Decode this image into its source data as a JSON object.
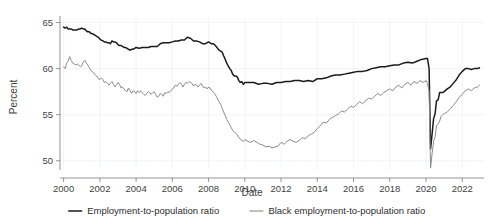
{
  "chart_data": {
    "type": "line",
    "title": "",
    "xlabel": "Date",
    "ylabel": "Percent",
    "xlim": [
      1999.8,
      2023.2
    ],
    "ylim": [
      49.0,
      65.6
    ],
    "grid": true,
    "legend_position": "bottom",
    "yticks": [
      50,
      55,
      60,
      65
    ],
    "ytick_labels": [
      "50",
      "55",
      "60",
      "65"
    ],
    "xticks": [
      2000,
      2002,
      2004,
      2006,
      2008,
      2010,
      2012,
      2014,
      2016,
      2018,
      2020,
      2022
    ],
    "xtick_labels": [
      "2000",
      "2002",
      "2004",
      "2006",
      "2008",
      "2010",
      "2012",
      "2014",
      "2016",
      "2018",
      "2020",
      "2022"
    ],
    "series": [
      {
        "name": "Employment-to-population ratio",
        "color": "#1a1a1a",
        "x": [
          2000.0,
          2000.08,
          2000.17,
          2000.25,
          2000.33,
          2000.42,
          2000.5,
          2000.58,
          2000.67,
          2000.75,
          2000.83,
          2000.92,
          2001.0,
          2001.08,
          2001.17,
          2001.25,
          2001.33,
          2001.42,
          2001.5,
          2001.58,
          2001.67,
          2001.75,
          2001.83,
          2001.92,
          2002.0,
          2002.08,
          2002.17,
          2002.25,
          2002.33,
          2002.42,
          2002.5,
          2002.58,
          2002.67,
          2002.75,
          2002.83,
          2002.92,
          2003.0,
          2003.08,
          2003.17,
          2003.25,
          2003.33,
          2003.42,
          2003.5,
          2003.58,
          2003.67,
          2003.75,
          2003.83,
          2003.92,
          2004.0,
          2004.17,
          2004.33,
          2004.5,
          2004.67,
          2004.83,
          2005.0,
          2005.17,
          2005.33,
          2005.5,
          2005.67,
          2005.83,
          2006.0,
          2006.17,
          2006.33,
          2006.5,
          2006.67,
          2006.83,
          2007.0,
          2007.17,
          2007.33,
          2007.5,
          2007.67,
          2007.83,
          2008.0,
          2008.08,
          2008.17,
          2008.25,
          2008.33,
          2008.42,
          2008.5,
          2008.58,
          2008.67,
          2008.75,
          2008.83,
          2008.92,
          2009.0,
          2009.08,
          2009.17,
          2009.25,
          2009.33,
          2009.42,
          2009.5,
          2009.58,
          2009.67,
          2009.75,
          2009.83,
          2009.92,
          2010.0,
          2010.25,
          2010.5,
          2010.75,
          2011.0,
          2011.25,
          2011.5,
          2011.75,
          2012.0,
          2012.25,
          2012.5,
          2012.75,
          2013.0,
          2013.25,
          2013.5,
          2013.75,
          2014.0,
          2014.25,
          2014.5,
          2014.75,
          2015.0,
          2015.25,
          2015.5,
          2015.75,
          2016.0,
          2016.25,
          2016.5,
          2016.75,
          2017.0,
          2017.25,
          2017.5,
          2017.75,
          2018.0,
          2018.25,
          2018.5,
          2018.75,
          2019.0,
          2019.25,
          2019.5,
          2019.75,
          2020.0,
          2020.08,
          2020.17,
          2020.25,
          2020.33,
          2020.42,
          2020.5,
          2020.58,
          2020.67,
          2020.75,
          2020.83,
          2020.92,
          2021.0,
          2021.17,
          2021.33,
          2021.5,
          2021.67,
          2021.83,
          2022.0,
          2022.17,
          2022.33,
          2022.5,
          2022.67,
          2022.83,
          2022.95
        ],
        "y": [
          64.5,
          64.4,
          64.5,
          64.3,
          64.3,
          64.3,
          64.2,
          64.2,
          64.2,
          64.2,
          64.3,
          64.3,
          64.4,
          64.3,
          64.3,
          64.1,
          64.0,
          64.0,
          63.8,
          63.8,
          63.7,
          63.6,
          63.5,
          63.4,
          63.2,
          63.1,
          63.0,
          62.9,
          62.9,
          62.8,
          62.8,
          62.7,
          63.0,
          62.9,
          62.9,
          62.8,
          62.6,
          62.5,
          62.5,
          62.4,
          62.3,
          62.3,
          62.2,
          62.1,
          62.0,
          62.1,
          62.1,
          62.2,
          62.3,
          62.2,
          62.3,
          62.3,
          62.3,
          62.4,
          62.4,
          62.4,
          62.7,
          62.8,
          62.8,
          62.8,
          62.9,
          63.0,
          63.0,
          63.1,
          63.1,
          63.4,
          63.3,
          63.0,
          63.0,
          62.9,
          62.7,
          62.7,
          62.9,
          62.8,
          62.7,
          62.7,
          62.6,
          62.4,
          62.2,
          62.0,
          61.9,
          61.8,
          61.4,
          61.0,
          60.6,
          60.3,
          60.0,
          59.8,
          59.4,
          59.2,
          59.2,
          59.1,
          58.7,
          58.5,
          58.6,
          58.3,
          58.5,
          58.5,
          58.5,
          58.3,
          58.4,
          58.4,
          58.3,
          58.5,
          58.5,
          58.6,
          58.6,
          58.7,
          58.7,
          58.6,
          58.7,
          58.6,
          58.9,
          58.9,
          59.0,
          59.2,
          59.3,
          59.3,
          59.4,
          59.5,
          59.6,
          59.7,
          59.7,
          59.8,
          60.0,
          60.1,
          60.2,
          60.2,
          60.3,
          60.4,
          60.4,
          60.6,
          60.7,
          60.6,
          60.8,
          61.0,
          61.1,
          61.1,
          60.0,
          51.3,
          52.8,
          54.6,
          55.1,
          56.5,
          56.6,
          57.4,
          57.4,
          57.4,
          57.5,
          57.8,
          58.0,
          58.4,
          58.8,
          59.3,
          59.7,
          60.0,
          60.0,
          59.9,
          60.0,
          60.0,
          60.1
        ]
      },
      {
        "name": "Black employment-to-population ratio",
        "color": "#8a8a8a",
        "x": [
          2000.0,
          2000.08,
          2000.17,
          2000.25,
          2000.33,
          2000.42,
          2000.5,
          2000.58,
          2000.67,
          2000.75,
          2000.83,
          2000.92,
          2001.0,
          2001.08,
          2001.17,
          2001.25,
          2001.33,
          2001.42,
          2001.5,
          2001.58,
          2001.67,
          2001.75,
          2001.83,
          2001.92,
          2002.0,
          2002.08,
          2002.17,
          2002.25,
          2002.33,
          2002.42,
          2002.5,
          2002.58,
          2002.67,
          2002.75,
          2002.83,
          2002.92,
          2003.0,
          2003.08,
          2003.17,
          2003.25,
          2003.33,
          2003.42,
          2003.5,
          2003.58,
          2003.67,
          2003.75,
          2003.83,
          2003.92,
          2004.0,
          2004.08,
          2004.17,
          2004.25,
          2004.33,
          2004.42,
          2004.5,
          2004.58,
          2004.67,
          2004.75,
          2004.83,
          2004.92,
          2005.0,
          2005.08,
          2005.17,
          2005.25,
          2005.33,
          2005.42,
          2005.5,
          2005.58,
          2005.67,
          2005.75,
          2005.83,
          2005.92,
          2006.0,
          2006.08,
          2006.17,
          2006.25,
          2006.33,
          2006.42,
          2006.5,
          2006.58,
          2006.67,
          2006.75,
          2006.83,
          2006.92,
          2007.0,
          2007.08,
          2007.17,
          2007.25,
          2007.33,
          2007.42,
          2007.5,
          2007.58,
          2007.67,
          2007.75,
          2007.83,
          2007.92,
          2008.0,
          2008.08,
          2008.17,
          2008.25,
          2008.33,
          2008.42,
          2008.5,
          2008.58,
          2008.67,
          2008.75,
          2008.83,
          2008.92,
          2009.0,
          2009.08,
          2009.17,
          2009.25,
          2009.33,
          2009.42,
          2009.5,
          2009.58,
          2009.67,
          2009.75,
          2009.83,
          2009.92,
          2010.0,
          2010.17,
          2010.33,
          2010.5,
          2010.67,
          2010.83,
          2011.0,
          2011.17,
          2011.33,
          2011.5,
          2011.67,
          2011.83,
          2012.0,
          2012.17,
          2012.33,
          2012.5,
          2012.67,
          2012.83,
          2013.0,
          2013.17,
          2013.33,
          2013.5,
          2013.67,
          2013.83,
          2014.0,
          2014.17,
          2014.33,
          2014.5,
          2014.67,
          2014.83,
          2015.0,
          2015.17,
          2015.33,
          2015.5,
          2015.67,
          2015.83,
          2016.0,
          2016.17,
          2016.33,
          2016.5,
          2016.67,
          2016.83,
          2017.0,
          2017.17,
          2017.33,
          2017.5,
          2017.67,
          2017.83,
          2018.0,
          2018.17,
          2018.33,
          2018.5,
          2018.67,
          2018.83,
          2019.0,
          2019.17,
          2019.33,
          2019.5,
          2019.67,
          2019.83,
          2020.0,
          2020.08,
          2020.17,
          2020.25,
          2020.33,
          2020.42,
          2020.5,
          2020.58,
          2020.67,
          2020.75,
          2020.83,
          2020.92,
          2021.0,
          2021.17,
          2021.33,
          2021.5,
          2021.67,
          2021.83,
          2022.0,
          2022.17,
          2022.33,
          2022.5,
          2022.67,
          2022.83,
          2022.95
        ],
        "y": [
          60.2,
          60.0,
          60.6,
          60.8,
          61.3,
          60.9,
          60.6,
          60.5,
          60.4,
          60.5,
          60.4,
          60.2,
          60.3,
          60.7,
          60.9,
          60.6,
          60.4,
          60.1,
          59.8,
          59.7,
          59.5,
          59.3,
          59.2,
          58.9,
          58.8,
          59.0,
          58.8,
          58.5,
          58.6,
          58.4,
          58.2,
          58.4,
          58.6,
          58.3,
          58.0,
          58.2,
          58.5,
          58.3,
          57.9,
          58.0,
          57.8,
          57.6,
          57.5,
          57.9,
          57.6,
          57.3,
          57.6,
          57.5,
          57.3,
          57.6,
          57.4,
          57.6,
          57.4,
          57.2,
          57.1,
          57.3,
          57.5,
          57.4,
          57.2,
          57.4,
          57.5,
          57.2,
          56.9,
          57.0,
          57.3,
          57.2,
          57.0,
          57.4,
          57.3,
          57.5,
          57.4,
          57.6,
          57.8,
          57.9,
          58.2,
          58.1,
          58.3,
          58.5,
          58.3,
          58.0,
          58.3,
          58.5,
          58.4,
          58.6,
          58.5,
          58.4,
          58.1,
          58.3,
          58.2,
          58.0,
          58.2,
          58.4,
          58.1,
          57.9,
          58.0,
          57.8,
          58.0,
          57.9,
          57.6,
          57.5,
          57.3,
          57.0,
          56.7,
          56.4,
          56.1,
          55.7,
          55.3,
          54.9,
          54.5,
          54.2,
          53.9,
          53.6,
          53.3,
          53.1,
          53.0,
          52.8,
          52.5,
          52.4,
          52.2,
          52.1,
          52.3,
          52.1,
          52.0,
          52.2,
          52.0,
          51.8,
          51.7,
          51.5,
          51.6,
          51.4,
          51.5,
          51.6,
          52.0,
          51.8,
          52.1,
          52.3,
          52.1,
          52.0,
          52.2,
          52.5,
          52.4,
          52.7,
          52.9,
          53.1,
          53.5,
          53.8,
          54.2,
          54.1,
          54.5,
          54.7,
          54.9,
          55.1,
          55.4,
          55.3,
          55.6,
          55.9,
          55.8,
          56.1,
          56.4,
          56.2,
          56.5,
          56.8,
          56.7,
          57.0,
          57.3,
          57.1,
          57.4,
          57.6,
          57.8,
          57.6,
          58.0,
          58.2,
          57.9,
          58.3,
          58.5,
          58.2,
          58.6,
          58.4,
          58.7,
          58.5,
          58.7,
          58.4,
          57.6,
          49.2,
          50.7,
          52.1,
          52.6,
          53.8,
          54.0,
          54.3,
          54.8,
          55.0,
          55.1,
          55.3,
          55.6,
          56.0,
          56.4,
          56.9,
          57.2,
          57.6,
          57.8,
          57.6,
          57.9,
          58.0,
          58.2
        ]
      }
    ]
  },
  "legend": {
    "items": [
      {
        "label": "Employment-to-population ratio",
        "color": "#1a1a1a"
      },
      {
        "label": "Black employment-to-population ratio",
        "color": "#8a8a8a"
      }
    ]
  }
}
